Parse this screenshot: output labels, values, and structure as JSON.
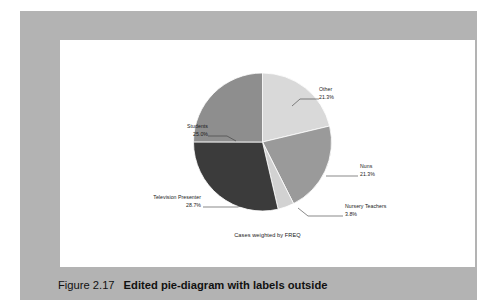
{
  "figure": {
    "caption_number": "Figure 2.17",
    "caption_text": "Edited pie-diagram with labels outside",
    "subtitle": "Cases weighted by FREQ"
  },
  "colors": {
    "frame": "#b3b3b3",
    "panel": "#ffffff",
    "page": "#ffffff",
    "text": "#1a1a1a"
  },
  "chart_data": {
    "type": "pie",
    "title": "",
    "subtitle": "Cases weighted by FREQ",
    "legend_position": "outside-labels",
    "start_angle_deg": 0,
    "direction": "clockwise",
    "categories": [
      "Other",
      "Nuns",
      "Nursery Teachers",
      "Television Presenter",
      "Students"
    ],
    "values": [
      21.3,
      21.3,
      3.8,
      28.7,
      25.0
    ],
    "value_unit": "%",
    "slice_colors": [
      "#d9d9d9",
      "#9a9a9a",
      "#d2d2d2",
      "#3b3b3b",
      "#8e8e8e"
    ],
    "slices": [
      {
        "label": "Other",
        "percent_label": "21.3%",
        "value": 21.3,
        "color": "#d9d9d9"
      },
      {
        "label": "Nuns",
        "percent_label": "21.3%",
        "value": 21.3,
        "color": "#9a9a9a"
      },
      {
        "label": "Nursery Teachers",
        "percent_label": "3.8%",
        "value": 3.8,
        "color": "#d2d2d2"
      },
      {
        "label": "Television Presenter",
        "percent_label": "28.7%",
        "value": 28.7,
        "color": "#3b3b3b"
      },
      {
        "label": "Students",
        "percent_label": "25.0%",
        "value": 25.0,
        "color": "#8e8e8e"
      }
    ]
  }
}
